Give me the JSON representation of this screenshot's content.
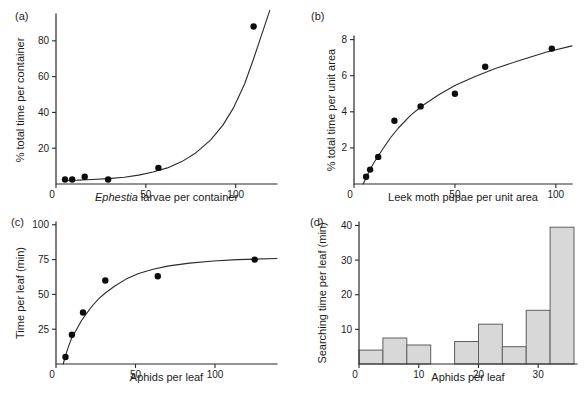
{
  "figure": {
    "background": "#ffffff",
    "ink": "#1c1c1c"
  },
  "chart_data": [
    {
      "id": "a",
      "panel_label": "(a)",
      "type": "scatter",
      "xlabel_italic": "Ephestia",
      "xlabel": " larvae per container",
      "ylabel": "% total time per container",
      "xlim": [
        0,
        123
      ],
      "ylim": [
        0,
        95
      ],
      "xticks": [
        0,
        50,
        100
      ],
      "yticks": [
        20,
        40,
        60,
        80
      ],
      "grid": false,
      "points": [
        [
          5,
          2.5
        ],
        [
          9,
          2.5
        ],
        [
          16,
          4
        ],
        [
          29,
          2.5
        ],
        [
          57,
          9
        ],
        [
          110,
          88
        ]
      ],
      "curve": [
        [
          4,
          2.1
        ],
        [
          12,
          2.2
        ],
        [
          20,
          2.5
        ],
        [
          29,
          3
        ],
        [
          38,
          3.8
        ],
        [
          46,
          5
        ],
        [
          54,
          6.7
        ],
        [
          62,
          9
        ],
        [
          70,
          12.5
        ],
        [
          78,
          17.5
        ],
        [
          86,
          24.5
        ],
        [
          93,
          33
        ],
        [
          99,
          43
        ],
        [
          105,
          56
        ],
        [
          110,
          70
        ],
        [
          115,
          85
        ],
        [
          119,
          97
        ]
      ]
    },
    {
      "id": "b",
      "panel_label": "(b)",
      "type": "scatter",
      "xlabel_italic": "",
      "xlabel": "Leek moth pupae per unit area",
      "ylabel": "% total time per unit area",
      "xlim": [
        0,
        108
      ],
      "ylim": [
        0,
        8.2
      ],
      "xticks": [
        0,
        50,
        100
      ],
      "yticks": [
        2,
        4,
        6,
        8
      ],
      "grid": false,
      "points": [
        [
          6,
          0.4
        ],
        [
          8,
          0.8
        ],
        [
          12,
          1.5
        ],
        [
          20,
          3.5
        ],
        [
          33,
          4.3
        ],
        [
          50,
          5.0
        ],
        [
          65,
          6.5
        ],
        [
          98,
          7.5
        ]
      ],
      "curve": [
        [
          4.5,
          0
        ],
        [
          6,
          0.35
        ],
        [
          8,
          0.8
        ],
        [
          10,
          1.2
        ],
        [
          14,
          1.9
        ],
        [
          18,
          2.55
        ],
        [
          22,
          3.1
        ],
        [
          28,
          3.8
        ],
        [
          34,
          4.35
        ],
        [
          42,
          4.95
        ],
        [
          50,
          5.45
        ],
        [
          60,
          5.95
        ],
        [
          70,
          6.4
        ],
        [
          82,
          6.85
        ],
        [
          95,
          7.3
        ],
        [
          108,
          7.65
        ]
      ]
    },
    {
      "id": "c",
      "panel_label": "(c)",
      "type": "scatter",
      "xlabel_italic": "",
      "xlabel": "Aphids per leaf",
      "ylabel": "Time per leaf (min)",
      "xlim": [
        0,
        139
      ],
      "ylim": [
        0,
        102
      ],
      "xticks": [
        0,
        50,
        100
      ],
      "yticks": [
        25,
        50,
        75,
        100
      ],
      "grid": false,
      "points": [
        [
          6,
          5
        ],
        [
          10,
          21
        ],
        [
          17,
          37
        ],
        [
          31,
          60
        ],
        [
          64,
          63
        ],
        [
          125,
          75
        ]
      ],
      "curve": [
        [
          4.5,
          0
        ],
        [
          6,
          6
        ],
        [
          8,
          13
        ],
        [
          10,
          19
        ],
        [
          13,
          25
        ],
        [
          16,
          31
        ],
        [
          19,
          36
        ],
        [
          23,
          42
        ],
        [
          27,
          47
        ],
        [
          31,
          51
        ],
        [
          37,
          56
        ],
        [
          44,
          61
        ],
        [
          52,
          65
        ],
        [
          61,
          68
        ],
        [
          71,
          70.5
        ],
        [
          84,
          72.5
        ],
        [
          99,
          74
        ],
        [
          114,
          75
        ],
        [
          139,
          75.8
        ]
      ]
    },
    {
      "id": "d",
      "panel_label": "(d)",
      "type": "bar",
      "xlabel_italic": "",
      "xlabel": "Aphids per leaf",
      "ylabel": "Searching time per leaf (min)",
      "xlim": [
        0,
        36.5
      ],
      "ylim": [
        0,
        41
      ],
      "xticks": [
        0,
        10,
        20,
        30
      ],
      "yticks": [
        10,
        20,
        30,
        40
      ],
      "grid": false,
      "bar_fill": "#d8d8d8",
      "bar_stroke": "#5f5f5f",
      "bars": [
        {
          "x0": 0,
          "x1": 4,
          "value": 4
        },
        {
          "x0": 4,
          "x1": 8,
          "value": 7.5
        },
        {
          "x0": 8,
          "x1": 12,
          "value": 5.5
        },
        {
          "x0": 16,
          "x1": 20,
          "value": 6.5
        },
        {
          "x0": 20,
          "x1": 24,
          "value": 11.5
        },
        {
          "x0": 24,
          "x1": 28,
          "value": 5
        },
        {
          "x0": 28,
          "x1": 32,
          "value": 15.5
        },
        {
          "x0": 32,
          "x1": 36,
          "value": 39.5
        }
      ]
    }
  ]
}
